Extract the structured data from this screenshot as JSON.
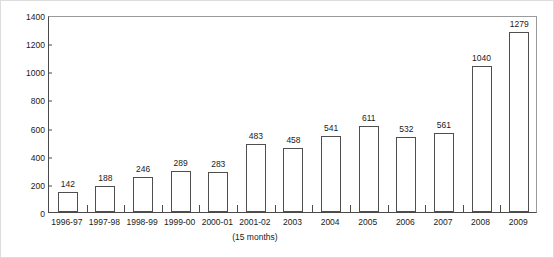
{
  "chart_data": {
    "type": "bar",
    "title": "",
    "xlabel": "",
    "ylabel": "Number of reports",
    "ylim": [
      0,
      1400
    ],
    "ytick_labels": [
      "0",
      "200",
      "400",
      "600",
      "800",
      "1000",
      "1200",
      "1400"
    ],
    "yticks": [
      0,
      200,
      400,
      600,
      800,
      1000,
      1200,
      1400
    ],
    "grid": false,
    "legend": "none",
    "categories": [
      "1996-97",
      "1997-98",
      "1998-99",
      "1999-00",
      "2000-01",
      "2001-02",
      "2003",
      "2004",
      "2005",
      "2006",
      "2007",
      "2008",
      "2009"
    ],
    "values": [
      142,
      188,
      246,
      289,
      283,
      483,
      458,
      541,
      611,
      532,
      561,
      1040,
      1279
    ],
    "value_labels": [
      "142",
      "188",
      "246",
      "289",
      "283",
      "483",
      "458",
      "541",
      "611",
      "532",
      "561",
      "1040",
      "1279"
    ],
    "annotations": [
      {
        "text": "(15 months)",
        "under_category": "2001-02"
      }
    ],
    "style": {
      "bar_fill": "#ffffff",
      "bar_edge": "#4f4f4f",
      "axis_color": "#4a4a4a",
      "frame_color": "#9b9b9b",
      "text_color": "#1a1a1a",
      "background": "#ffffff"
    }
  }
}
